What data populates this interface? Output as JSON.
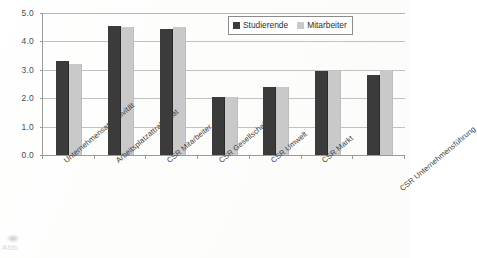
{
  "chart_data": {
    "type": "bar",
    "title": "",
    "subtitle": "",
    "xlabel": "",
    "ylabel": "",
    "ylim": [
      0.0,
      5.0
    ],
    "ytick_step": 1.0,
    "ytick_labels": [
      "0.0",
      "1.0",
      "2.0",
      "3.0",
      "4.0",
      "5.0"
    ],
    "ytick_values": [
      0.0,
      1.0,
      2.0,
      3.0,
      4.0,
      5.0
    ],
    "grid": "horizontal",
    "legend_position": "top-right",
    "categories": [
      "Unternehmensattraktivität",
      "Arbeitsplatzattraktivität",
      "CSR Mitarbeiter",
      "CSR Gesellschaft",
      "CSR Umwelt",
      "CSR Markt",
      "CSR Unternehmensführung"
    ],
    "series": [
      {
        "name": "Studierende",
        "color": "#3b3b3b",
        "values": [
          3.3,
          4.55,
          4.45,
          2.05,
          2.4,
          2.95,
          2.8
        ]
      },
      {
        "name": "Mitarbeiter",
        "color": "#c9c9c9",
        "values": [
          3.2,
          4.5,
          4.5,
          2.05,
          2.4,
          2.95,
          3.0
        ]
      }
    ]
  },
  "legend": {
    "items": [
      {
        "label": "Studierende",
        "swatch": "dark-square-swatch"
      },
      {
        "label": "Mitarbeiter",
        "swatch": "light-square-swatch"
      }
    ]
  },
  "page": {
    "bottom_fragment": "Abb."
  }
}
